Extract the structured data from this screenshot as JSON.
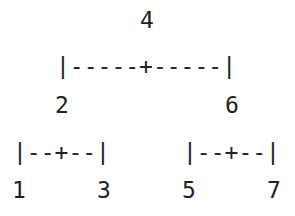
{
  "tree": {
    "root": "4",
    "root_connector": "|-----+-----|",
    "level1": {
      "left": "2",
      "right": "6"
    },
    "left_connector": "|--+--|",
    "right_connector": "|--+--|",
    "leaves": [
      "1",
      "3",
      "5",
      "7"
    ]
  }
}
